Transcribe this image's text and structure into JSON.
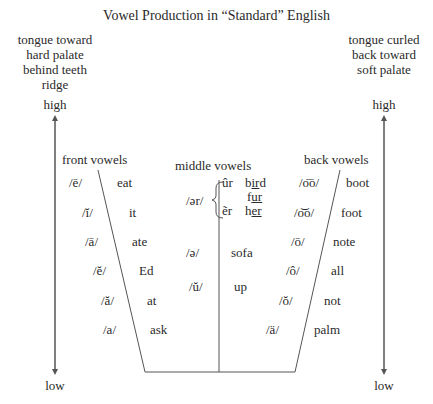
{
  "title": "Vowel Production in “Standard” English",
  "left_note": [
    "tongue toward",
    "hard palate",
    "behind teeth",
    "ridge"
  ],
  "right_note": [
    "tongue curled",
    "back toward",
    "soft palate"
  ],
  "axis": {
    "high": "high",
    "low": "low"
  },
  "groups": {
    "front": {
      "label": "front vowels",
      "items": [
        {
          "symbol": "/ē/",
          "word": "eat"
        },
        {
          "symbol": "/ĭ/",
          "word": "it"
        },
        {
          "symbol": "/ā/",
          "word": "ate"
        },
        {
          "symbol": "/ĕ/",
          "word": "Ed"
        },
        {
          "symbol": "/ă/",
          "word": "at"
        },
        {
          "symbol": "/a/",
          "word": "ask"
        }
      ]
    },
    "middle": {
      "label": "middle vowels",
      "r_group": {
        "symbol": "/ər/",
        "variants": [
          {
            "symbol": "ûr",
            "word_pre": "b",
            "word_u": "ir",
            "word_post": "d"
          },
          {
            "symbol": "",
            "word_pre": "f",
            "word_u": "ur",
            "word_post": ""
          },
          {
            "symbol": "ẽr",
            "word_pre": "h",
            "word_u": "er",
            "word_post": ""
          }
        ]
      },
      "items": [
        {
          "symbol": "/ə/",
          "word": "sofa"
        },
        {
          "symbol": "/ŭ/",
          "word": "up"
        }
      ]
    },
    "back": {
      "label": "back vowels",
      "items": [
        {
          "symbol": "/o͞o/",
          "word": "boot"
        },
        {
          "symbol": "/o͝o/",
          "word": "foot"
        },
        {
          "symbol": "/ō/",
          "word": "note"
        },
        {
          "symbol": "/ô/",
          "word": "all"
        },
        {
          "symbol": "/ŏ/",
          "word": "not"
        },
        {
          "symbol": "/ä/",
          "word": "palm"
        }
      ]
    }
  },
  "colors": {
    "line": "#555555",
    "text": "#2a2a2a"
  }
}
